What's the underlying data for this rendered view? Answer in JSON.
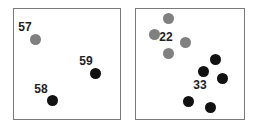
{
  "colors": {
    "gray": "#808080",
    "black": "#111111",
    "border": "#7a7a7a"
  },
  "panels": [
    {
      "name": "left",
      "box": {
        "x": 13,
        "y": 8,
        "w": 108,
        "h": 112
      },
      "points": [
        {
          "x": 35,
          "y": 39,
          "color": "gray"
        },
        {
          "x": 95,
          "y": 73,
          "color": "black"
        },
        {
          "x": 52,
          "y": 100,
          "color": "black"
        }
      ],
      "labels": [
        {
          "text": "57",
          "x": 25,
          "y": 27
        },
        {
          "text": "59",
          "x": 86,
          "y": 61
        },
        {
          "text": "58",
          "x": 41,
          "y": 89
        }
      ]
    },
    {
      "name": "right",
      "box": {
        "x": 135,
        "y": 8,
        "w": 110,
        "h": 112
      },
      "points": [
        {
          "x": 168,
          "y": 18,
          "color": "gray"
        },
        {
          "x": 154,
          "y": 34,
          "color": "gray"
        },
        {
          "x": 185,
          "y": 42,
          "color": "gray"
        },
        {
          "x": 168,
          "y": 53,
          "color": "gray"
        },
        {
          "x": 215,
          "y": 59,
          "color": "black"
        },
        {
          "x": 203,
          "y": 71,
          "color": "black"
        },
        {
          "x": 222,
          "y": 78,
          "color": "black"
        },
        {
          "x": 188,
          "y": 101,
          "color": "black"
        },
        {
          "x": 210,
          "y": 107,
          "color": "black"
        }
      ],
      "labels": [
        {
          "text": "22",
          "x": 166,
          "y": 37
        },
        {
          "text": "33",
          "x": 200,
          "y": 85
        }
      ]
    }
  ]
}
